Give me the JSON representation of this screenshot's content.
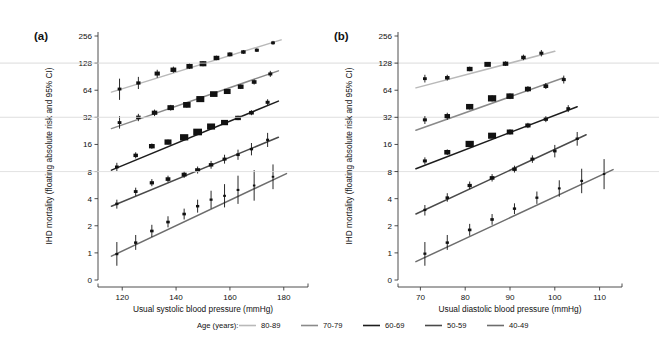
{
  "figure": {
    "legend_title": "Age (years):",
    "series_order": [
      "80-89",
      "70-79",
      "60-69",
      "50-59",
      "40-49"
    ],
    "series_colors": {
      "80-89": "#b9b9b9",
      "70-79": "#8a8a8a",
      "60-69": "#1d1d1d",
      "50-59": "#4a4a4a",
      "40-49": "#6d6d6d"
    },
    "legend_items": [
      {
        "label": "80-89",
        "color": "#b9b9b9"
      },
      {
        "label": "70-79",
        "color": "#8a8a8a"
      },
      {
        "label": "60-69",
        "color": "#1d1d1d"
      },
      {
        "label": "50-59",
        "color": "#4a4a4a"
      },
      {
        "label": "40-49",
        "color": "#6d6d6d"
      }
    ]
  },
  "chart_data": [
    {
      "type": "scatter",
      "panel": "(a)",
      "title": "",
      "xlabel": "Usual systolic blood pressure (mmHg)",
      "ylabel": "IHD mortality (floating absolute risk and 95% CI)",
      "yscale": "log2",
      "ytick_labels": [
        "256",
        "128",
        "64",
        "32",
        "16",
        "8",
        "4",
        "2",
        "1",
        "0"
      ],
      "ytick_values": [
        256,
        128,
        64,
        32,
        16,
        8,
        4,
        2,
        1,
        0
      ],
      "xtick_labels": [
        "120",
        "140",
        "160",
        "180"
      ],
      "xtick_values": [
        120,
        140,
        160,
        180
      ],
      "xlim": [
        111,
        189
      ],
      "grid": "horizontal-faint",
      "legend_position": "below-figure",
      "series": [
        {
          "name": "80-89",
          "color": "#b9b9b9",
          "x": [
            119,
            126,
            133,
            139,
            145,
            150,
            155,
            160,
            165,
            170,
            176
          ],
          "values": [
            66,
            77,
            98,
            108,
            118,
            126,
            146,
            160,
            170,
            178,
            215
          ],
          "ci_low": [
            50,
            66,
            88,
            100,
            110,
            118,
            138,
            152,
            162,
            170,
            205
          ],
          "ci_high": [
            86,
            90,
            108,
            117,
            127,
            135,
            155,
            169,
            179,
            187,
            226
          ],
          "marker_sizes": [
            3.0,
            3.4,
            4.2,
            4.6,
            5.0,
            5.4,
            4.6,
            4.0,
            3.6,
            3.2,
            3.0
          ],
          "fit": {
            "x0": 116,
            "y0": 61,
            "x1": 179,
            "y1": 232
          }
        },
        {
          "name": "70-79",
          "color": "#8a8a8a",
          "x": [
            119,
            126,
            132,
            138,
            144,
            149,
            154,
            159,
            164,
            169,
            175
          ],
          "values": [
            28,
            32,
            36,
            41,
            44,
            51,
            58,
            62,
            70,
            79,
            97
          ],
          "ci_low": [
            24,
            29,
            33,
            38,
            41,
            48,
            55,
            59,
            66,
            74,
            90
          ],
          "ci_high": [
            33,
            35,
            39,
            44,
            47,
            54,
            61,
            65,
            74,
            84,
            105
          ],
          "marker_sizes": [
            3.0,
            3.6,
            4.4,
            5.2,
            6.0,
            6.4,
            6.0,
            5.4,
            4.6,
            3.8,
            3.2
          ],
          "fit": {
            "x0": 116,
            "y0": 24,
            "x1": 178,
            "y1": 105
          }
        },
        {
          "name": "60-69",
          "color": "#1d1d1d",
          "x": [
            118,
            125,
            131,
            137,
            143,
            148,
            153,
            158,
            163,
            168,
            174
          ],
          "values": [
            9.0,
            12.1,
            15.3,
            17.0,
            19.2,
            22.0,
            25.3,
            28.0,
            31.5,
            36.0,
            47.0
          ],
          "ci_low": [
            8.1,
            11.2,
            14.3,
            16.0,
            18.1,
            20.8,
            24.0,
            26.5,
            29.8,
            33.8,
            43.5
          ],
          "ci_high": [
            10.0,
            13.1,
            16.4,
            18.1,
            20.4,
            23.3,
            26.7,
            29.6,
            33.3,
            38.4,
            50.8
          ],
          "marker_sizes": [
            3.0,
            3.6,
            4.6,
            5.6,
            6.6,
            7.0,
            6.4,
            5.6,
            4.6,
            3.8,
            3.2
          ],
          "fit": {
            "x0": 116,
            "y0": 8.3,
            "x1": 178,
            "y1": 48.5
          }
        },
        {
          "name": "50-59",
          "color": "#4a4a4a",
          "x": [
            118,
            125,
            131,
            137,
            143,
            148,
            153,
            158,
            163,
            168,
            174
          ],
          "values": [
            3.5,
            4.8,
            6.0,
            6.6,
            7.4,
            8.3,
            9.5,
            11.0,
            12.3,
            14.2,
            18.0
          ],
          "ci_low": [
            3.1,
            4.3,
            5.5,
            6.1,
            6.8,
            7.6,
            8.6,
            9.8,
            10.8,
            12.1,
            15.0
          ],
          "ci_high": [
            3.9,
            5.3,
            6.6,
            7.2,
            8.1,
            9.1,
            10.5,
            12.3,
            14.0,
            16.6,
            21.5
          ],
          "marker_sizes": [
            2.6,
            3.0,
            3.4,
            3.8,
            4.0,
            4.0,
            3.6,
            3.2,
            2.8,
            2.6,
            2.4
          ],
          "fit": {
            "x0": 116,
            "y0": 3.3,
            "x1": 178,
            "y1": 19.2
          }
        },
        {
          "name": "40-49",
          "color": "#6d6d6d",
          "x": [
            118,
            125,
            131,
            137,
            143,
            148,
            153,
            158,
            163,
            169,
            176
          ],
          "values": [
            0.97,
            1.3,
            1.75,
            2.2,
            2.7,
            3.3,
            3.9,
            4.3,
            5.0,
            5.6,
            7.0
          ],
          "ci_low": [
            0.72,
            1.08,
            1.5,
            1.92,
            2.35,
            2.8,
            3.1,
            3.2,
            3.5,
            3.8,
            5.1
          ],
          "ci_high": [
            1.32,
            1.58,
            2.05,
            2.55,
            3.1,
            3.9,
            4.9,
            5.8,
            7.2,
            8.3,
            9.6
          ],
          "marker_sizes": [
            2.4,
            2.6,
            2.8,
            2.8,
            2.8,
            2.6,
            2.4,
            2.2,
            2.2,
            2.0,
            2.0
          ],
          "fit": {
            "x0": 116,
            "y0": 0.92,
            "x1": 181,
            "y1": 7.6
          }
        }
      ]
    },
    {
      "type": "scatter",
      "panel": "(b)",
      "title": "",
      "xlabel": "Usual diastolic blood pressure (mmHg)",
      "ylabel": "IHD mortality (floating absolute risk and 95% CI)",
      "yscale": "log2",
      "ytick_labels": [
        "256",
        "128",
        "64",
        "32",
        "16",
        "8",
        "4",
        "2",
        "1",
        "0"
      ],
      "ytick_values": [
        256,
        128,
        64,
        32,
        16,
        8,
        4,
        2,
        1,
        0
      ],
      "xtick_labels": [
        "70",
        "80",
        "90",
        "100",
        "110"
      ],
      "xtick_values": [
        70,
        80,
        90,
        100,
        110
      ],
      "xlim": [
        65,
        115
      ],
      "grid": "horizontal-faint",
      "legend_position": "below-figure",
      "series": [
        {
          "name": "80-89",
          "color": "#b9b9b9",
          "x": [
            71,
            76,
            81,
            85,
            89,
            93,
            97
          ],
          "values": [
            86,
            88,
            110,
            124,
            126,
            148,
            165
          ],
          "ci_low": [
            78,
            82,
            104,
            118,
            119,
            138,
            152
          ],
          "ci_high": [
            95,
            95,
            117,
            131,
            134,
            159,
            179
          ],
          "marker_sizes": [
            3.0,
            3.6,
            4.6,
            5.2,
            4.4,
            3.6,
            3.2
          ],
          "fit": {
            "x0": 69,
            "y0": 68,
            "x1": 100,
            "y1": 173
          }
        },
        {
          "name": "70-79",
          "color": "#8a8a8a",
          "x": [
            71,
            76,
            81,
            86,
            90,
            94,
            98,
            102
          ],
          "values": [
            30,
            33,
            42,
            52,
            55,
            66,
            71,
            84
          ],
          "ci_low": [
            27,
            30,
            39,
            48,
            51,
            61,
            66,
            76
          ],
          "ci_high": [
            33,
            36,
            45,
            56,
            59,
            71,
            77,
            93
          ],
          "marker_sizes": [
            3.2,
            4.4,
            5.8,
            6.6,
            5.8,
            4.8,
            3.8,
            3.2
          ],
          "fit": {
            "x0": 69,
            "y0": 23,
            "x1": 102,
            "y1": 88
          }
        },
        {
          "name": "60-69",
          "color": "#1d1d1d",
          "x": [
            71,
            76,
            81,
            86,
            90,
            94,
            98,
            103
          ],
          "values": [
            10.5,
            13.1,
            16.2,
            20.0,
            22.0,
            26.0,
            30.5,
            40.0
          ],
          "ci_low": [
            9.6,
            12.2,
            15.2,
            18.8,
            20.6,
            24.3,
            28.3,
            36.6
          ],
          "ci_high": [
            11.5,
            14.1,
            17.3,
            21.3,
            23.5,
            27.8,
            32.9,
            43.7
          ],
          "marker_sizes": [
            3.2,
            4.8,
            6.6,
            6.4,
            5.2,
            4.2,
            3.4,
            3.0
          ],
          "fit": {
            "x0": 69,
            "y0": 8.6,
            "x1": 105,
            "y1": 42.0
          }
        },
        {
          "name": "50-59",
          "color": "#4a4a4a",
          "x": [
            71,
            76,
            81,
            86,
            91,
            95,
            100,
            105
          ],
          "values": [
            3.0,
            4.1,
            5.6,
            6.8,
            8.5,
            11.0,
            13.5,
            18.5
          ],
          "ci_low": [
            2.6,
            3.7,
            5.1,
            6.2,
            7.8,
            10.0,
            11.5,
            15.5
          ],
          "ci_high": [
            3.4,
            4.6,
            6.2,
            7.5,
            9.3,
            12.1,
            15.8,
            22.0
          ],
          "marker_sizes": [
            2.4,
            2.8,
            3.4,
            3.8,
            3.6,
            3.2,
            2.8,
            2.6
          ],
          "fit": {
            "x0": 69,
            "y0": 2.7,
            "x1": 107,
            "y1": 20.5
          }
        },
        {
          "name": "40-49",
          "color": "#6d6d6d",
          "x": [
            71,
            76,
            81,
            86,
            91,
            96,
            101,
            106,
            111
          ],
          "values": [
            0.98,
            1.3,
            1.8,
            2.35,
            3.1,
            4.1,
            5.2,
            6.3,
            7.5
          ],
          "ci_low": [
            0.72,
            1.08,
            1.55,
            2.05,
            2.7,
            3.5,
            4.2,
            4.6,
            5.1
          ],
          "ci_high": [
            1.32,
            1.58,
            2.1,
            2.7,
            3.55,
            4.8,
            6.4,
            8.6,
            11.0
          ],
          "marker_sizes": [
            2.4,
            2.6,
            2.8,
            2.8,
            2.6,
            2.4,
            2.2,
            2.2,
            2.0
          ],
          "fit": {
            "x0": 69,
            "y0": 0.8,
            "x1": 113,
            "y1": 8.4
          }
        }
      ]
    }
  ]
}
